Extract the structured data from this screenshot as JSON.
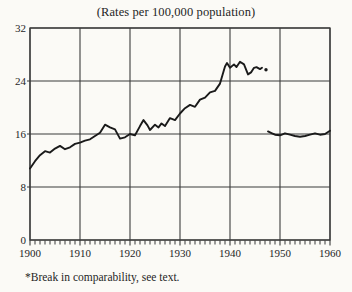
{
  "figure": {
    "title": "(Rates per 100,000 population)",
    "footnote": "*Break in comparability, see text."
  },
  "chart_data": {
    "type": "line",
    "title": "(Rates per 100,000 population)",
    "footnote": "*Break in comparability, see text.",
    "xlabel": "",
    "ylabel": "",
    "xlim": [
      1900,
      1960
    ],
    "ylim": [
      0,
      32
    ],
    "x_ticks": [
      1900,
      1910,
      1920,
      1930,
      1940,
      1950,
      1960
    ],
    "y_ticks": [
      0,
      8,
      16,
      24,
      32
    ],
    "minor_x_tick_interval": 1,
    "grid": true,
    "legend": false,
    "ink_color": "#1a1a1a",
    "grid_color": "#3b3b3b",
    "background_color": "#fbfaf6",
    "series": [
      {
        "name": "pre-break",
        "points": [
          [
            1900,
            10.8
          ],
          [
            1901,
            11.9
          ],
          [
            1902,
            12.8
          ],
          [
            1903,
            13.4
          ],
          [
            1904,
            13.2
          ],
          [
            1905,
            13.8
          ],
          [
            1906,
            14.2
          ],
          [
            1907,
            13.7
          ],
          [
            1908,
            14.0
          ],
          [
            1909,
            14.5
          ],
          [
            1910,
            14.7
          ],
          [
            1911,
            15.0
          ],
          [
            1912,
            15.2
          ],
          [
            1913,
            15.7
          ],
          [
            1914,
            16.2
          ],
          [
            1915,
            17.4
          ],
          [
            1916,
            17.0
          ],
          [
            1917,
            16.7
          ],
          [
            1918,
            15.3
          ],
          [
            1919,
            15.5
          ],
          [
            1920,
            16.0
          ],
          [
            1921,
            15.8
          ],
          [
            1922,
            17.2
          ],
          [
            1922.7,
            18.1
          ],
          [
            1923.5,
            17.3
          ],
          [
            1924,
            16.6
          ],
          [
            1925,
            17.4
          ],
          [
            1925.7,
            17.0
          ],
          [
            1926.3,
            17.6
          ],
          [
            1927,
            17.2
          ],
          [
            1928,
            18.4
          ],
          [
            1929,
            18.1
          ],
          [
            1930,
            19.1
          ],
          [
            1931,
            19.9
          ],
          [
            1932,
            20.4
          ],
          [
            1933,
            20.1
          ],
          [
            1934,
            21.2
          ],
          [
            1935,
            21.5
          ],
          [
            1936,
            22.3
          ],
          [
            1937,
            22.5
          ],
          [
            1938,
            23.6
          ],
          [
            1939,
            26.2
          ],
          [
            1939.4,
            26.7
          ],
          [
            1940,
            26.0
          ],
          [
            1940.8,
            26.5
          ],
          [
            1941.3,
            26.1
          ],
          [
            1942,
            26.9
          ],
          [
            1942.8,
            26.5
          ],
          [
            1943.6,
            25.0
          ],
          [
            1944.2,
            25.3
          ],
          [
            1944.8,
            26.0
          ],
          [
            1945.3,
            26.1
          ],
          [
            1946,
            25.8
          ],
          [
            1946.4,
            26.0
          ]
        ]
      },
      {
        "name": "post-break",
        "points": [
          [
            1947.6,
            16.4
          ],
          [
            1948.4,
            16.1
          ],
          [
            1949,
            15.9
          ],
          [
            1950,
            15.8
          ],
          [
            1951,
            16.1
          ],
          [
            1952,
            15.9
          ],
          [
            1953,
            15.7
          ],
          [
            1954,
            15.6
          ],
          [
            1955,
            15.7
          ],
          [
            1956,
            15.9
          ],
          [
            1957,
            16.1
          ],
          [
            1958,
            15.9
          ],
          [
            1959,
            16.0
          ],
          [
            1960,
            16.5
          ]
        ]
      }
    ],
    "break_marker_point": [
      1947.2,
      25.7
    ]
  }
}
